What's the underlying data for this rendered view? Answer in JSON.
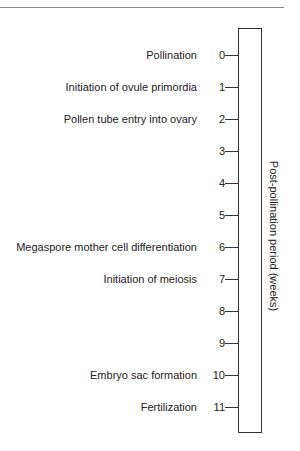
{
  "diagram": {
    "axis_label": "Post-pollination period (weeks)",
    "ticks": [
      {
        "week": "0",
        "event": "Pollination"
      },
      {
        "week": "1",
        "event": "Initiation of ovule primordia"
      },
      {
        "week": "2",
        "event": "Pollen tube entry into ovary"
      },
      {
        "week": "3",
        "event": ""
      },
      {
        "week": "4",
        "event": ""
      },
      {
        "week": "5",
        "event": ""
      },
      {
        "week": "6",
        "event": "Megaspore mother cell differentiation"
      },
      {
        "week": "7",
        "event": "Initiation of meiosis"
      },
      {
        "week": "8",
        "event": ""
      },
      {
        "week": "9",
        "event": ""
      },
      {
        "week": "10",
        "event": "Embryo sac formation"
      },
      {
        "week": "11",
        "event": "Fertilization"
      }
    ]
  },
  "colors": {
    "line": "#333333",
    "text": "#222222",
    "header_rule": "#8a8a8a"
  }
}
